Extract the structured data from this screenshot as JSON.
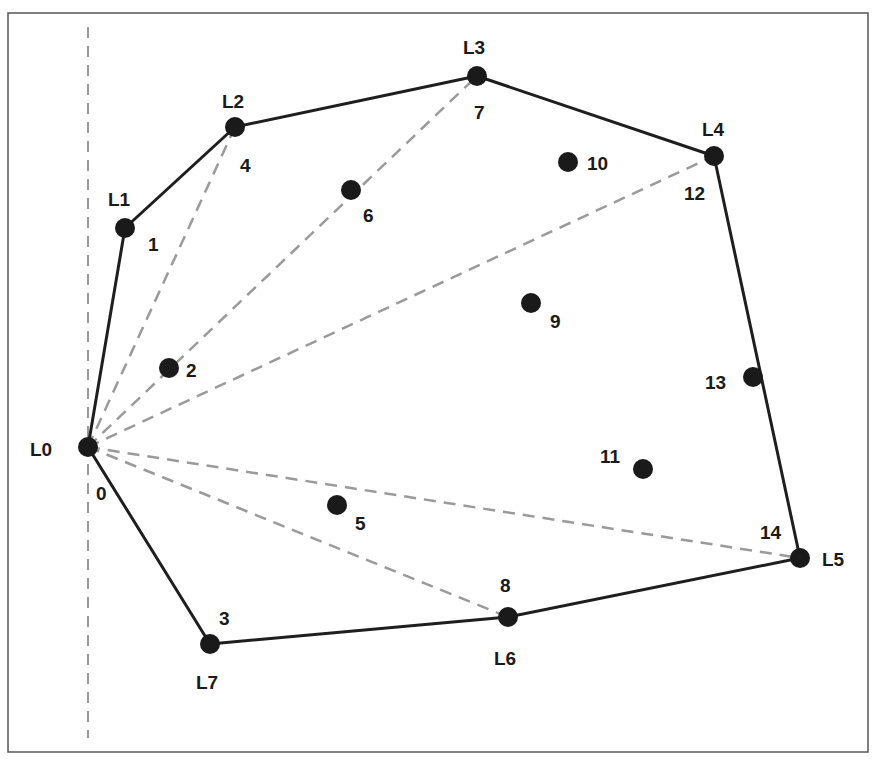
{
  "figure": {
    "frame": {
      "x": 8,
      "y": 13,
      "width": 860,
      "height": 739,
      "stroke": "#555555"
    },
    "baseline": {
      "x": 88,
      "y1": 27,
      "y2": 738,
      "color": "#9a9a9a"
    },
    "colors": {
      "hull": "#1e1e1e",
      "point": "#1a1a1a",
      "dashed": "#9a9a9a"
    },
    "points": [
      {
        "id": "0",
        "x": 88,
        "y": 447,
        "label": "0",
        "lx": 96,
        "ly": 500
      },
      {
        "id": "1",
        "x": 125,
        "y": 228,
        "label": "1",
        "lx": 148,
        "ly": 251
      },
      {
        "id": "2",
        "x": 169,
        "y": 368,
        "label": "2",
        "lx": 186,
        "ly": 377
      },
      {
        "id": "3",
        "x": 210,
        "y": 644,
        "label": "3",
        "lx": 219,
        "ly": 625
      },
      {
        "id": "4",
        "x": 235,
        "y": 127,
        "label": "4",
        "lx": 240,
        "ly": 172
      },
      {
        "id": "5",
        "x": 337,
        "y": 505,
        "label": "5",
        "lx": 355,
        "ly": 530
      },
      {
        "id": "6",
        "x": 351,
        "y": 190,
        "label": "6",
        "lx": 363,
        "ly": 222
      },
      {
        "id": "7",
        "x": 477,
        "y": 76,
        "label": "7",
        "lx": 474,
        "ly": 119
      },
      {
        "id": "8",
        "x": 508,
        "y": 617,
        "label": "8",
        "lx": 500,
        "ly": 592
      },
      {
        "id": "9",
        "x": 531,
        "y": 303,
        "label": "9",
        "lx": 550,
        "ly": 328
      },
      {
        "id": "10",
        "x": 568,
        "y": 162,
        "label": "10",
        "lx": 587,
        "ly": 170
      },
      {
        "id": "11",
        "x": 643,
        "y": 469,
        "label": "11",
        "lx": 600,
        "ly": 463
      },
      {
        "id": "12",
        "x": 714,
        "y": 156,
        "label": "12",
        "lx": 684,
        "ly": 200
      },
      {
        "id": "13",
        "x": 753,
        "y": 377,
        "label": "13",
        "lx": 705,
        "ly": 389
      },
      {
        "id": "14",
        "x": 800,
        "y": 558,
        "label": "14",
        "lx": 760,
        "ly": 539
      }
    ],
    "hull_labels": [
      {
        "text": "L0",
        "x": 30,
        "y": 456
      },
      {
        "text": "L1",
        "x": 108,
        "y": 206
      },
      {
        "text": "L2",
        "x": 222,
        "y": 108
      },
      {
        "text": "L3",
        "x": 463,
        "y": 54
      },
      {
        "text": "L4",
        "x": 702,
        "y": 136
      },
      {
        "text": "L5",
        "x": 822,
        "y": 566
      },
      {
        "text": "L6",
        "x": 494,
        "y": 665
      },
      {
        "text": "L7",
        "x": 196,
        "y": 689
      }
    ],
    "hull_order": [
      "0",
      "1",
      "4",
      "7",
      "12",
      "14",
      "8",
      "3"
    ],
    "dashed_rays_from": "0",
    "dashed_rays_to": [
      "4",
      "7",
      "12",
      "14",
      "8"
    ]
  }
}
